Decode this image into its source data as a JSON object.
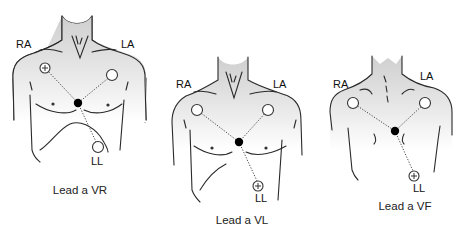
{
  "figures": [
    {
      "caption": "Lead a VR",
      "labels": {
        "right_arm": "RA",
        "left_arm": "LA",
        "left_leg": "LL"
      },
      "positive_electrode": "RA",
      "view": "anterior"
    },
    {
      "caption": "Lead a VL",
      "labels": {
        "right_arm": "RA",
        "left_arm": "LA",
        "left_leg": "LL"
      },
      "positive_electrode": "LL",
      "view": "anterior"
    },
    {
      "caption": "Lead a VF",
      "labels": {
        "right_arm": "RA",
        "left_arm": "LA",
        "left_leg": "LL"
      },
      "positive_electrode": "LL",
      "view": "posterior"
    }
  ],
  "symbols": {
    "positive": "+"
  },
  "colors": {
    "skin_top": "#cfcfcf",
    "skin_bottom": "#ffffff",
    "line": "#2a2a2a",
    "central_terminal": "#000000"
  }
}
